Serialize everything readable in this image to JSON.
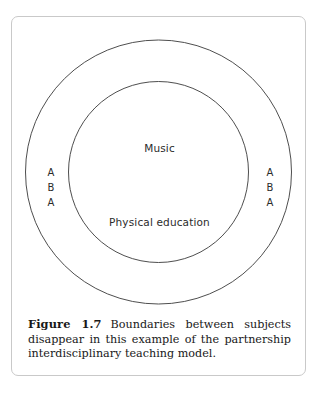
{
  "figure": {
    "caption_number": "Figure 1.7",
    "caption_text": "Boundaries between subjects disappear in this example of the partnership interdisciplinary teaching model.",
    "border_color": "#c9c9c9",
    "background_color": "#ffffff"
  },
  "diagram": {
    "type": "concentric-venn",
    "stroke_color": "#3a3a3a",
    "outer_circle": {
      "label_left": [
        "A",
        "B",
        "A"
      ],
      "label_right": [
        "A",
        "B",
        "A"
      ]
    },
    "inner_circle": {
      "label_top": "Music",
      "label_bottom": "Physical education"
    },
    "labels": {
      "music": "Music",
      "physical_education": "Physical education",
      "aba_left_1": "A",
      "aba_left_2": "B",
      "aba_left_3": "A",
      "aba_right_1": "A",
      "aba_right_2": "B",
      "aba_right_3": "A"
    }
  }
}
